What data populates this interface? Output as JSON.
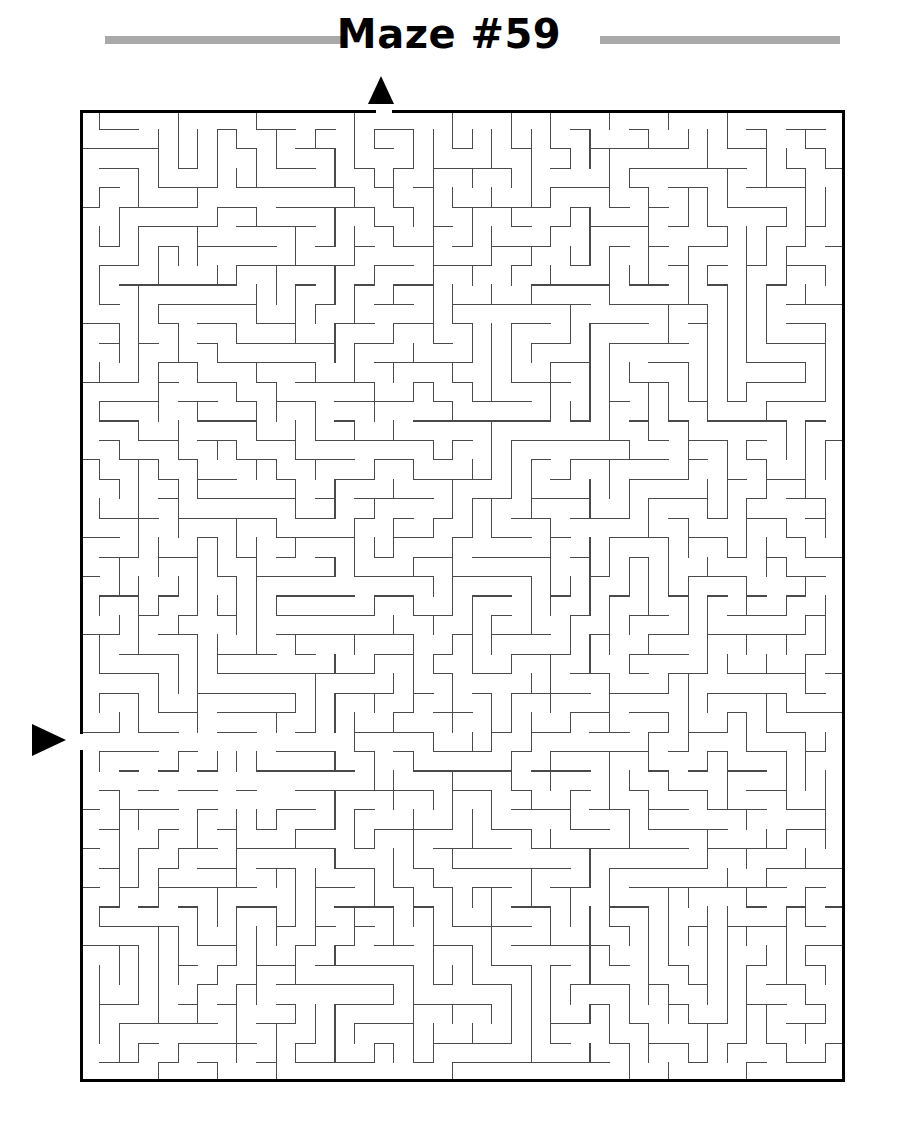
{
  "page": {
    "background_color": "#ffffff",
    "width": 898,
    "height": 1126
  },
  "header": {
    "title": "Maze #59",
    "title_color": "#000000",
    "rule_color": "#9a9a9a",
    "rules": [
      {
        "name": "left-rule",
        "x": 105,
        "y": 36,
        "width": 240,
        "height": 8
      },
      {
        "name": "right-rule",
        "x": 600,
        "y": 36,
        "width": 240,
        "height": 8
      }
    ]
  },
  "markers": {
    "entrance": {
      "label": "entrance-arrow",
      "direction": "down",
      "x": 381,
      "y": 90,
      "color": "#000000",
      "side": "top",
      "grid_column": 15
    },
    "exit": {
      "label": "exit-arrow",
      "direction": "right",
      "x": 49,
      "y": 740,
      "color": "#000000",
      "side": "left",
      "grid_row": 32
    }
  },
  "maze": {
    "name": "maze-grid",
    "origin_x": 80,
    "origin_y": 110,
    "width": 765,
    "height": 972,
    "columns": 39,
    "rows": 50,
    "cell_size": 19.615,
    "border_color": "#000000",
    "border_width": 3,
    "wall_color": "#4a4a4a",
    "wall_width": 1.1,
    "entrance_gap": {
      "side": "top",
      "index": 15
    },
    "exit_gap": {
      "side": "left",
      "index": 32
    },
    "seed": 5909,
    "generation": "depth-first-backtracker"
  }
}
